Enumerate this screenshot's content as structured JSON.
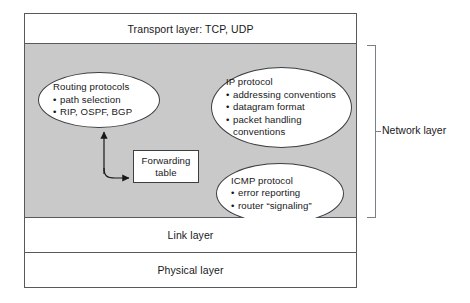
{
  "diagram": {
    "colors": {
      "network_band_fill": "#c9c9c9",
      "frame_stroke": "#555a5e",
      "shape_stroke": "#3c3f42",
      "bracket_stroke": "#7c8084",
      "text": "#17181a",
      "background": "#ffffff"
    }
  },
  "layers": {
    "transport": "Transport layer: TCP, UDP",
    "link": "Link layer",
    "physical": "Physical layer"
  },
  "bracket": {
    "label": "Network layer"
  },
  "routing_ellipse": {
    "title": "Routing protocols",
    "items": [
      "path selection",
      "RIP, OSPF, BGP"
    ]
  },
  "ip_ellipse": {
    "title": "IP protocol",
    "items": [
      "addressing conventions",
      "datagram format",
      "packet handling"
    ],
    "continuation": "conventions"
  },
  "icmp_ellipse": {
    "title": "ICMP protocol",
    "items": [
      "error reporting",
      "router “signaling”"
    ]
  },
  "forwarding_table": {
    "line1": "Forwarding",
    "line2": "table"
  },
  "bullet_glyph": "•"
}
